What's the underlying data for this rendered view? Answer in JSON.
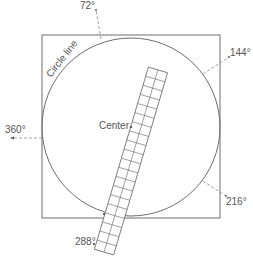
{
  "diagram": {
    "labels": {
      "circle_line": "Circle line",
      "center": "Center",
      "angle_72": "72°",
      "angle_144": "144°",
      "angle_216": "216°",
      "angle_288": "288°",
      "angle_360": "360°"
    },
    "colors": {
      "stroke": "#6e6e6e",
      "text": "#555555",
      "background": "#ffffff"
    },
    "square": {
      "left": 42,
      "top": 35,
      "right": 220,
      "bottom": 218
    },
    "circle": {
      "cx": 131,
      "cy": 127,
      "r": 89
    },
    "ruler": {
      "columns": 2,
      "rows": 20
    }
  }
}
